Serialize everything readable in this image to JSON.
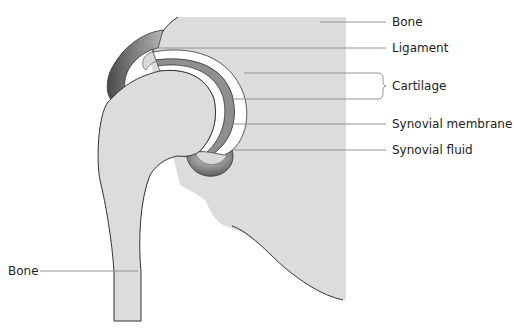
{
  "diagram": {
    "labels": [
      {
        "id": "bone-upper",
        "text": "Bone",
        "x": 392,
        "y": 16
      },
      {
        "id": "ligament",
        "text": "Ligament",
        "x": 392,
        "y": 42
      },
      {
        "id": "cartilage",
        "text": "Cartilage",
        "x": 392,
        "y": 80
      },
      {
        "id": "synovial-membrane",
        "text": "Synovial membrane",
        "x": 392,
        "y": 119
      },
      {
        "id": "synovial-fluid",
        "text": "Synovial fluid",
        "x": 392,
        "y": 145
      },
      {
        "id": "bone-lower",
        "text": "Bone",
        "x": 8,
        "y": 264
      }
    ],
    "colors": {
      "bone": "#dcdcdc",
      "bone_dark": "#cfcfcf",
      "ligament_dark": "#5a5a5a",
      "ligament_light": "#9a9a9a",
      "cartilage": "#ffffff",
      "membrane": "#8c8c8c",
      "outline": "#333333",
      "leader": "#888888"
    }
  }
}
